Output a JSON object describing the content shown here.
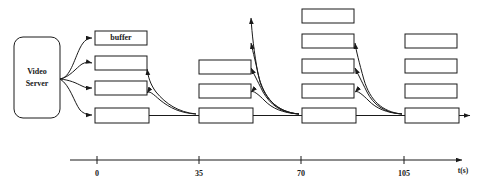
{
  "figure": {
    "kind": "timeline-block-diagram",
    "background_color": "#ffffff",
    "stroke_color": "#1a1a1a"
  },
  "source": {
    "label_line1": "Video",
    "label_line2": "Server",
    "shape": "rounded-rectangle",
    "x": 14,
    "y": 37,
    "width": 46,
    "height": 81
  },
  "buffer_annotation": {
    "label": "buffer"
  },
  "groups": [
    {
      "name": "group-t0",
      "time": "0",
      "box_count": 4,
      "boxes": [
        {
          "label": "buffer",
          "x": 95,
          "y": 31,
          "width": 52,
          "height": 14,
          "labelled": true
        },
        {
          "label": "",
          "x": 95,
          "y": 56,
          "width": 52,
          "height": 14,
          "labelled": false
        },
        {
          "label": "",
          "x": 95,
          "y": 81,
          "width": 52,
          "height": 14,
          "labelled": false
        },
        {
          "label": "",
          "x": 95,
          "y": 108,
          "width": 54,
          "height": 15,
          "labelled": false
        }
      ]
    },
    {
      "name": "group-t35",
      "time": "35",
      "box_count": 3,
      "boxes": [
        {
          "label": "",
          "x": 199,
          "y": 60,
          "width": 52,
          "height": 14,
          "labelled": false
        },
        {
          "label": "",
          "x": 199,
          "y": 84,
          "width": 52,
          "height": 14,
          "labelled": false
        },
        {
          "label": "",
          "x": 199,
          "y": 108,
          "width": 54,
          "height": 15,
          "labelled": false
        }
      ]
    },
    {
      "name": "group-t70",
      "time": "70",
      "box_count": 5,
      "boxes": [
        {
          "label": "",
          "x": 302,
          "y": 9,
          "width": 52,
          "height": 14,
          "labelled": false
        },
        {
          "label": "",
          "x": 302,
          "y": 34,
          "width": 52,
          "height": 14,
          "labelled": false
        },
        {
          "label": "",
          "x": 302,
          "y": 59,
          "width": 52,
          "height": 14,
          "labelled": false
        },
        {
          "label": "",
          "x": 302,
          "y": 84,
          "width": 52,
          "height": 14,
          "labelled": false
        },
        {
          "label": "",
          "x": 302,
          "y": 108,
          "width": 54,
          "height": 15,
          "labelled": false
        }
      ]
    },
    {
      "name": "group-t105",
      "time": "105",
      "box_count": 4,
      "boxes": [
        {
          "label": "",
          "x": 405,
          "y": 34,
          "width": 52,
          "height": 14,
          "labelled": false
        },
        {
          "label": "",
          "x": 405,
          "y": 59,
          "width": 52,
          "height": 14,
          "labelled": false
        },
        {
          "label": "",
          "x": 405,
          "y": 84,
          "width": 52,
          "height": 14,
          "labelled": false
        },
        {
          "label": "",
          "x": 405,
          "y": 108,
          "width": 54,
          "height": 15,
          "labelled": false
        }
      ]
    }
  ],
  "axis": {
    "title": "t(s)",
    "line_start_x": 70,
    "line_end_x": 462,
    "line_y": 160,
    "ticks": [
      {
        "label": "0",
        "x": 97
      },
      {
        "label": "35",
        "x": 199
      },
      {
        "label": "70",
        "x": 301
      },
      {
        "label": "105",
        "x": 404
      }
    ]
  }
}
